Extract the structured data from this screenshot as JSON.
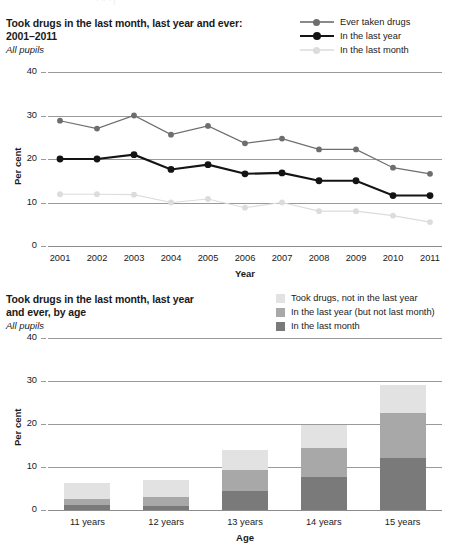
{
  "top_strip_text": "· ·· · |",
  "line_chart": {
    "title": "Took drugs in the last month, last year and ever: 2001–2011",
    "title_line1": "Took drugs in the last month, last year and ever:",
    "title_line2": "2001–2011",
    "subtitle": "All pupils",
    "legend": [
      {
        "label": "Ever taken drugs",
        "color": "#6e6e6e",
        "marker": "circle"
      },
      {
        "label": "In the last year",
        "color": "#141414",
        "marker": "circle"
      },
      {
        "label": "In the last month",
        "color": "#dcdcdc",
        "marker": "circle"
      }
    ]
  },
  "bar_chart": {
    "title_line1": "Took drugs in the last month, last year",
    "title_line2": "and ever, by age",
    "subtitle": "All pupils",
    "legend": [
      {
        "label": "Took drugs, not in the last year",
        "color": "#e2e2e2"
      },
      {
        "label": "In the last year (but not last month)",
        "color": "#a8a8a8"
      },
      {
        "label": "In the last month",
        "color": "#7a7a7a"
      }
    ]
  },
  "chart_data": [
    {
      "type": "line",
      "title": "Took drugs in the last month, last year and ever: 2001–2011",
      "subtitle": "All pupils",
      "xlabel": "Year",
      "ylabel": "Per cent",
      "ylim": [
        0,
        40
      ],
      "yticks": [
        0,
        10,
        20,
        30,
        40
      ],
      "grid": true,
      "legend_position": "top-right",
      "categories": [
        "2001",
        "2002",
        "2003",
        "2004",
        "2005",
        "2006",
        "2007",
        "2008",
        "2009",
        "2010",
        "2011"
      ],
      "series": [
        {
          "name": "Ever taken drugs",
          "color": "#6e6e6e",
          "values": [
            28.8,
            27.0,
            30.0,
            25.6,
            27.6,
            23.6,
            24.7,
            22.2,
            22.2,
            18.0,
            16.6
          ]
        },
        {
          "name": "In the last year",
          "color": "#141414",
          "values": [
            20.0,
            20.0,
            21.0,
            17.6,
            18.7,
            16.6,
            16.8,
            15.0,
            15.0,
            11.6,
            11.6
          ]
        },
        {
          "name": "In the last month",
          "color": "#dcdcdc",
          "values": [
            11.9,
            11.9,
            11.8,
            10.0,
            10.8,
            8.8,
            10.0,
            8.0,
            8.0,
            7.0,
            5.5
          ]
        }
      ]
    },
    {
      "type": "bar",
      "subtype": "stacked",
      "title": "Took drugs in the last month, last year and ever, by age",
      "subtitle": "All pupils",
      "xlabel": "Age",
      "ylabel": "Per cent",
      "ylim": [
        0,
        40
      ],
      "yticks": [
        0,
        10,
        20,
        30,
        40
      ],
      "grid": true,
      "legend_position": "top-right",
      "categories": [
        "11 years",
        "12 years",
        "13 years",
        "14 years",
        "15 years"
      ],
      "series": [
        {
          "name": "In the last month",
          "color": "#7a7a7a",
          "values": [
            1.2,
            1.0,
            4.5,
            7.7,
            12.0
          ]
        },
        {
          "name": "In the last year (but not last month)",
          "color": "#a8a8a8",
          "values": [
            1.4,
            2.0,
            4.8,
            6.7,
            10.5
          ]
        },
        {
          "name": "Took drugs, not in the last year",
          "color": "#e2e2e2",
          "values": [
            3.7,
            4.0,
            4.7,
            5.4,
            6.5
          ]
        }
      ],
      "totals": [
        6.3,
        7.0,
        14.0,
        19.8,
        29.0
      ]
    }
  ]
}
